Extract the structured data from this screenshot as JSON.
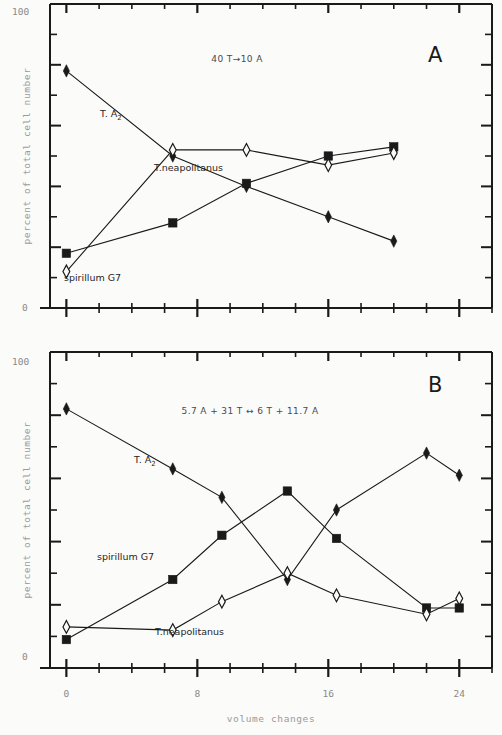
{
  "figure": {
    "background": "#fbfbfa",
    "ink": "#1a1a1a",
    "xlabel": "volume changes",
    "ylabel": "percent of total cell number"
  },
  "chart_data": [
    {
      "type": "line",
      "panel": "A",
      "title": "",
      "annotation": "40 T→10 A",
      "xlabel": "volume changes",
      "ylabel": "percent of total cell number",
      "xlim": [
        -1,
        26
      ],
      "ylim": [
        0,
        100
      ],
      "xticks": [
        0,
        8,
        16,
        24
      ],
      "xticklabels": [
        "0",
        "8",
        "16",
        "24"
      ],
      "yticks": [
        0,
        100
      ],
      "yticklabels": [
        "100",
        "0"
      ],
      "grid": false,
      "legend": "inline-labels",
      "series": [
        {
          "name": "T. A2",
          "label": "T. A",
          "label_sub": "2",
          "marker": "filled-diamond",
          "x": [
            0,
            6.5,
            11,
            16,
            20
          ],
          "y": [
            78,
            50,
            40,
            30,
            22
          ],
          "label_pos": {
            "x": 6.0,
            "y": 65
          }
        },
        {
          "name": "spirillum G7",
          "label": "spirillum G7",
          "marker": "filled-square",
          "x": [
            0,
            6.5,
            11,
            16,
            20
          ],
          "y": [
            18,
            28,
            41,
            50,
            53
          ],
          "label_pos": {
            "x": 5.2,
            "y": 20
          }
        },
        {
          "name": "T.neapolitanus",
          "label": "T.neapolitanus",
          "marker": "open-diamond",
          "x": [
            0,
            6.5,
            11,
            16,
            20
          ],
          "y": [
            12,
            52,
            52,
            47,
            51
          ],
          "label_pos": {
            "x": 7.6,
            "y": 58
          }
        }
      ]
    },
    {
      "type": "line",
      "panel": "B",
      "title": "",
      "annotation": "5.7 A + 31 T ↔ 6 T + 11.7 A",
      "xlabel": "volume changes",
      "ylabel": "percent of total cell number",
      "xlim": [
        -1,
        26
      ],
      "ylim": [
        0,
        100
      ],
      "xticks": [
        0,
        8,
        16,
        24
      ],
      "xticklabels": [
        "0",
        "8",
        "16",
        "24"
      ],
      "yticks": [
        0,
        100
      ],
      "yticklabels": [
        "100",
        "0"
      ],
      "grid": false,
      "legend": "inline-labels",
      "series": [
        {
          "name": "T. A2",
          "label": "T. A",
          "label_sub": "2",
          "marker": "filled-diamond",
          "x": [
            0,
            6.5,
            9.5,
            13.5,
            16.5,
            22,
            24
          ],
          "y": [
            82,
            63,
            54,
            28,
            50,
            68,
            61
          ],
          "label_pos": {
            "x": 5.2,
            "y": 66
          }
        },
        {
          "name": "spirillum G7",
          "label": "spirillum G7",
          "marker": "filled-square",
          "x": [
            0,
            6.5,
            9.5,
            13.5,
            16.5,
            22,
            24
          ],
          "y": [
            9,
            28,
            42,
            56,
            41,
            19,
            19
          ]
        },
        {
          "name": "T.neapolitanus",
          "label": "T.neapolitanus",
          "marker": "open-diamond",
          "x": [
            0,
            6.5,
            9.5,
            13.5,
            16.5,
            22,
            24
          ],
          "y": [
            13,
            12,
            21,
            30,
            23,
            17,
            22
          ]
        }
      ]
    }
  ],
  "panelA": {
    "letter": "A",
    "annotation": "40 T→10 A",
    "y_top_label": "100",
    "y_bottom_label": "0",
    "labels": {
      "ta2": "T. A",
      "ta2_sub": "2",
      "spirillum": "spirillum G7",
      "neapolitanus": "T.neapolitanus"
    }
  },
  "panelB": {
    "letter": "B",
    "annotation": "5.7 A + 31 T ↔ 6 T + 11.7 A",
    "y_top_label": "100",
    "y_bottom_label": "0",
    "labels": {
      "ta2": "T. A",
      "ta2_sub": "2",
      "spirillum": "spirillum G7",
      "neapolitanus": "T.neapolitanus"
    }
  },
  "xaxis": {
    "label": "volume changes",
    "ticklabels": [
      "0",
      "8",
      "16",
      "24"
    ]
  },
  "yaxis": {
    "label": "percent of total cell number"
  }
}
